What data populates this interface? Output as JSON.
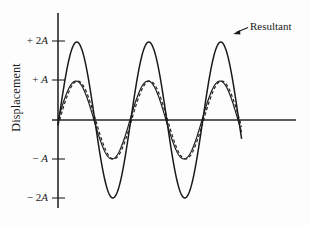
{
  "chart_data": {
    "type": "line",
    "title": "",
    "xlabel": "",
    "ylabel": "Displacement",
    "ylim": [
      -2.6,
      2.6
    ],
    "xlim": [
      0,
      3.3
    ],
    "grid": false,
    "legend_position": "none",
    "y_ticks": [
      {
        "value": 2,
        "label_sign": "+ 2",
        "label_unit": "A"
      },
      {
        "value": 1,
        "label_sign": "+ ",
        "label_unit": "A"
      },
      {
        "value": -1,
        "label_sign": "− ",
        "label_unit": "A"
      },
      {
        "value": -2,
        "label_sign": "− 2",
        "label_unit": "A"
      }
    ],
    "annotations": [
      {
        "text": "Resultant",
        "points_to": "resultant-peak-right"
      }
    ],
    "series": [
      {
        "name": "component-wave-1",
        "style": "solid",
        "amplitude": 1.0,
        "phase_deg": 0,
        "periods_drawn": 2.55,
        "description": "First component sine wave of amplitude A"
      },
      {
        "name": "component-wave-2",
        "style": "dashed",
        "amplitude": 1.0,
        "phase_deg": -8,
        "periods_drawn": 2.55,
        "description": "Second component sine wave of amplitude A, slightly lagging"
      },
      {
        "name": "resultant-wave",
        "style": "solid",
        "amplitude": 2.0,
        "phase_deg": -4,
        "periods_drawn": 2.55,
        "description": "Resultant of the two components, amplitude 2A"
      }
    ]
  },
  "axes": {
    "y_axis_name": "vertical-axis",
    "x_axis_name": "horizontal-axis"
  }
}
